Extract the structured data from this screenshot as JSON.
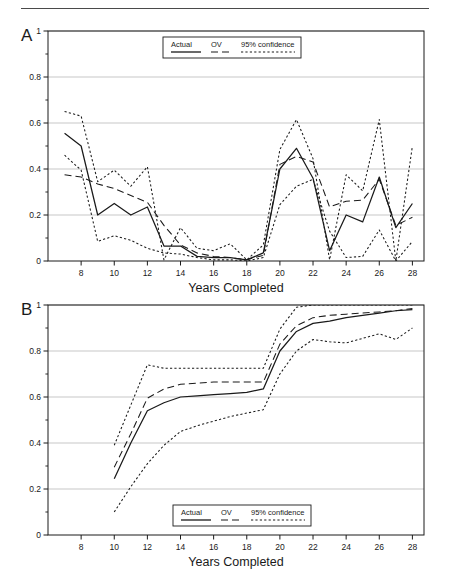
{
  "figure": {
    "panels": [
      {
        "id": "A",
        "letter": "A"
      },
      {
        "id": "B",
        "letter": "B"
      }
    ],
    "header_rule": "horizontal-rule"
  },
  "legend": {
    "items": [
      {
        "label": "Actual",
        "style": "solid"
      },
      {
        "label": "OV",
        "style": "dashed"
      },
      {
        "label": "95% confidence",
        "style": "dotted"
      }
    ]
  },
  "chart_data": [
    {
      "type": "line",
      "panel": "A",
      "title": "A",
      "xlabel": "Years Completed",
      "ylabel": "",
      "xlim": [
        6,
        28.7
      ],
      "ylim": [
        0,
        1
      ],
      "grid": true,
      "legend_position": "top-center",
      "xticks": [
        8,
        10,
        12,
        14,
        16,
        18,
        20,
        22,
        24,
        26,
        28
      ],
      "xtick_labels": [
        "8",
        "10",
        "12",
        "14",
        "16",
        "18",
        "20",
        "22",
        "24",
        "26",
        "28"
      ],
      "yticks": [
        0,
        0.2,
        0.4,
        0.6,
        0.8,
        1
      ],
      "ytick_labels": [
        "0",
        "0.2",
        "0.4",
        "0.6",
        "0.8",
        "1"
      ],
      "x": [
        7,
        8,
        9,
        10,
        11,
        12,
        13,
        14,
        15,
        16,
        17,
        18,
        19,
        20,
        21,
        22,
        23,
        24,
        25,
        26,
        27,
        28
      ],
      "series": [
        {
          "name": "Actual",
          "style": "solid",
          "values": [
            0.555,
            0.5,
            0.2,
            0.25,
            0.2,
            0.235,
            0.065,
            0.065,
            0.02,
            0.015,
            0.015,
            0.005,
            0.035,
            0.4,
            0.49,
            0.36,
            0.045,
            0.2,
            0.17,
            0.365,
            0.145,
            0.25
          ]
        },
        {
          "name": "OV",
          "style": "dashed",
          "values": [
            0.375,
            0.365,
            0.335,
            0.315,
            0.285,
            0.255,
            0.155,
            0.07,
            0.035,
            0.02,
            0.015,
            0.005,
            0.025,
            0.42,
            0.455,
            0.43,
            0.235,
            0.26,
            0.265,
            0.355,
            0.155,
            0.19
          ]
        },
        {
          "name": "95% confidence upper",
          "style": "dotted",
          "values": [
            0.65,
            0.63,
            0.345,
            0.395,
            0.325,
            0.41,
            0.005,
            0.145,
            0.055,
            0.045,
            0.075,
            0.005,
            0.07,
            0.485,
            0.615,
            0.445,
            0.005,
            0.375,
            0.305,
            0.615,
            0.0,
            0.5
          ]
        },
        {
          "name": "95% confidence lower",
          "style": "dotted",
          "values": [
            0.46,
            0.395,
            0.085,
            0.11,
            0.09,
            0.055,
            0.035,
            0.03,
            0.015,
            0.005,
            0.005,
            0.0,
            0.015,
            0.245,
            0.325,
            0.355,
            0.13,
            0.015,
            0.02,
            0.135,
            0.0,
            0.085
          ]
        }
      ]
    },
    {
      "type": "line",
      "panel": "B",
      "title": "B",
      "xlabel": "Years Completed",
      "ylabel": "",
      "xlim": [
        6,
        28.7
      ],
      "ylim": [
        0,
        1
      ],
      "grid": true,
      "legend_position": "bottom-center",
      "xticks": [
        8,
        10,
        12,
        14,
        16,
        18,
        20,
        22,
        24,
        26,
        28
      ],
      "xtick_labels": [
        "8",
        "10",
        "12",
        "14",
        "16",
        "18",
        "20",
        "22",
        "24",
        "26",
        "28"
      ],
      "yticks": [
        0,
        0.2,
        0.4,
        0.6,
        0.8,
        1
      ],
      "ytick_labels": [
        "0",
        "0.2",
        "0.4",
        "0.6",
        "0.8",
        "1"
      ],
      "x": [
        10,
        11,
        12,
        13,
        14,
        15,
        16,
        17,
        18,
        19,
        20,
        21,
        22,
        23,
        24,
        25,
        26,
        27,
        28
      ],
      "series": [
        {
          "name": "Actual",
          "style": "solid",
          "values": [
            0.245,
            0.4,
            0.54,
            0.575,
            0.6,
            0.605,
            0.61,
            0.615,
            0.62,
            0.635,
            0.8,
            0.885,
            0.92,
            0.93,
            0.945,
            0.955,
            0.965,
            0.975,
            0.98
          ]
        },
        {
          "name": "OV",
          "style": "dashed",
          "values": [
            0.295,
            0.44,
            0.595,
            0.635,
            0.655,
            0.66,
            0.665,
            0.665,
            0.665,
            0.665,
            0.83,
            0.91,
            0.945,
            0.955,
            0.96,
            0.965,
            0.97,
            0.975,
            0.985
          ]
        },
        {
          "name": "95% confidence upper",
          "style": "dotted",
          "values": [
            0.39,
            0.565,
            0.74,
            0.725,
            0.725,
            0.725,
            0.725,
            0.725,
            0.725,
            0.725,
            0.895,
            0.99,
            1.0,
            1.0,
            1.0,
            1.0,
            1.0,
            1.0,
            1.0
          ]
        },
        {
          "name": "95% confidence lower",
          "style": "dotted",
          "values": [
            0.1,
            0.21,
            0.31,
            0.39,
            0.45,
            0.475,
            0.495,
            0.515,
            0.53,
            0.545,
            0.7,
            0.8,
            0.85,
            0.84,
            0.835,
            0.855,
            0.875,
            0.85,
            0.9
          ]
        }
      ]
    }
  ]
}
